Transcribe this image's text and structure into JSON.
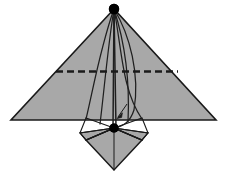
{
  "figure": {
    "type": "line-diagram",
    "canvas": {
      "width": 226,
      "height": 172
    },
    "background_color": "#ffffff",
    "colors": {
      "fill_gray": "#a8a8a8",
      "fill_gray_light": "#b0b0b0",
      "stroke_dark": "#1a1a1a",
      "stroke_mid": "#2b2b2b",
      "node_black": "#000000",
      "dashed_line": "#1a1a1a"
    },
    "nodes": [
      {
        "name": "apex-node",
        "x": 114,
        "y": 9,
        "radius": 5.2,
        "label": ""
      },
      {
        "name": "keel-node",
        "x": 114,
        "y": 128,
        "radius": 4.6,
        "label": ""
      }
    ],
    "wing": {
      "name": "delta-wing-surface",
      "points": "114,9 11,120 216,120",
      "apex": [
        114,
        9
      ],
      "left_tip": [
        11,
        120
      ],
      "right_tip": [
        216,
        120
      ]
    },
    "spreader_dashed_line": {
      "name": "spreader-bar",
      "x1": 56,
      "y1": 71.5,
      "x2": 178,
      "y2": 71.5,
      "dash_pattern": "7,4"
    },
    "lower_sail": {
      "name": "lower-kite-sail",
      "points": "114,128 86,140 114,170 142,140"
    },
    "lower_left_panel": {
      "name": "lower-left-panel-outline",
      "points": "114,128 80,133 86,140 114,128"
    },
    "lower_right_panel": {
      "name": "lower-right-panel-outline",
      "points": "114,128 148,133 142,140 114,128"
    },
    "outer_frame_left": {
      "name": "left-outer-frame",
      "points": "80,133 86,118 114,128 86,140"
    },
    "outer_frame_right": {
      "name": "right-outer-frame",
      "points": "148,133 142,118 114,128 142,140"
    },
    "bridle_lines": [
      {
        "name": "bridle-line-1",
        "d": "M114,9 C100,48 92,95 86,119"
      },
      {
        "name": "bridle-line-2",
        "d": "M114,9 C108,45 104,92 100,124"
      },
      {
        "name": "bridle-line-3",
        "d": "M114,9 L113,128"
      },
      {
        "name": "bridle-line-4",
        "d": "M114,9 L116,128"
      },
      {
        "name": "bridle-line-5",
        "d": "M114,9 C124,40 130,80 128,122"
      },
      {
        "name": "bridle-line-6",
        "d": "M114,9 C130,35 140,75 134,110 C130,122 124,126 114,128"
      },
      {
        "name": "bridle-line-7",
        "d": "M114,9 C122,50 122,90 142,119"
      }
    ],
    "keel_lines": [
      {
        "name": "keel-line-left",
        "d": "M114,128 L80,133"
      },
      {
        "name": "keel-line-right",
        "d": "M114,128 L148,133"
      },
      {
        "name": "keel-line-lower-left",
        "d": "M114,128 L86,140"
      },
      {
        "name": "keel-line-lower-right",
        "d": "M114,128 L142,140"
      },
      {
        "name": "keel-spine",
        "d": "M114,128 L114,170"
      }
    ],
    "annotation_arrow": {
      "name": "direction-arrow",
      "tip_x": 117,
      "tip_y": 118,
      "tail_x": 127,
      "tail_y": 104,
      "label": ""
    },
    "labels": []
  }
}
